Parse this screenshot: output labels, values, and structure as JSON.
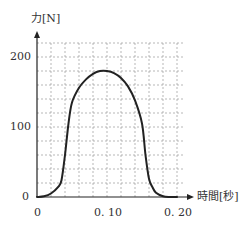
{
  "chart_data": {
    "type": "line",
    "title": "",
    "xlabel": "時間[秒]",
    "ylabel": "力[N]",
    "xlim": [
      0,
      0.2
    ],
    "ylim": [
      0,
      200
    ],
    "x_ticks": [
      0,
      0.1,
      0.2
    ],
    "x_tick_labels": [
      "0",
      "0. 10",
      "0. 20"
    ],
    "y_ticks": [
      0,
      100,
      200
    ],
    "y_tick_labels": [
      "0",
      "100",
      "200"
    ],
    "grid": true,
    "grid_style": "dotted",
    "x_grid_step": 0.02,
    "y_grid_step": 20,
    "series": [
      {
        "name": "力",
        "color": "#222222",
        "x": [
          0,
          0.01,
          0.02,
          0.03,
          0.035,
          0.04,
          0.045,
          0.05,
          0.06,
          0.07,
          0.08,
          0.09,
          0.1,
          0.11,
          0.12,
          0.13,
          0.14,
          0.15,
          0.155,
          0.16,
          0.165,
          0.17,
          0.18,
          0.19,
          0.2
        ],
        "values": [
          0,
          1,
          5,
          14,
          24,
          60,
          105,
          135,
          156,
          168,
          176,
          180,
          180,
          177,
          170,
          158,
          138,
          105,
          60,
          26,
          14,
          6,
          1,
          0,
          0
        ]
      }
    ]
  },
  "labels": {
    "y_axis": "力[N]",
    "x_axis": "時間[秒]",
    "y200": "200",
    "y100": "100",
    "y0": "0",
    "x0": "0",
    "x010": "0. 10",
    "x020": "0. 20"
  }
}
